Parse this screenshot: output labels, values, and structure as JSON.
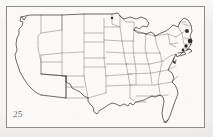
{
  "document": {
    "kind": "scanned-outline-map",
    "page_number": "25",
    "subject": "Contiguous United States state-boundary outline map",
    "frame": {
      "visible": true,
      "style": "thin single rule rectangle"
    }
  },
  "colors": {
    "background": "#f4f3f1",
    "plate": "#fbfaf9",
    "frame_line": "#8e8c89",
    "coastline": "#3a3936",
    "state_line": "#6b6a66",
    "ink_blob": "#2b2a28",
    "page_number_text": "#4a4845"
  },
  "map": {
    "title": "",
    "projection_note": "",
    "outline_stroke_width": 0.7,
    "state_stroke_width": 0.45,
    "ink_marks": [
      {
        "name": "northeast-ink-mark-1",
        "cx": 187,
        "cy": 31,
        "r": 1.9
      },
      {
        "name": "northeast-ink-mark-2",
        "cx": 190,
        "cy": 41,
        "r": 2.3
      },
      {
        "name": "northeast-ink-mark-3",
        "cx": 186,
        "cy": 46,
        "r": 1.7
      },
      {
        "name": "northeast-ink-mark-4",
        "cx": 183,
        "cy": 50,
        "r": 1.4
      },
      {
        "name": "great-lakes-ink-mark",
        "cx": 112,
        "cy": 18,
        "r": 1.2
      },
      {
        "name": "mid-atlantic-ink-mark",
        "cx": 174,
        "cy": 62,
        "r": 1.1
      }
    ],
    "regions": [
      {
        "name": "pacific-northwest",
        "states": [
          "Washington",
          "Oregon",
          "Idaho"
        ]
      },
      {
        "name": "california-nevada",
        "states": [
          "California",
          "Nevada"
        ]
      },
      {
        "name": "mountain-west",
        "states": [
          "Montana",
          "Wyoming",
          "Utah",
          "Colorado"
        ]
      },
      {
        "name": "southwest",
        "states": [
          "Arizona",
          "New Mexico"
        ]
      },
      {
        "name": "great-plains",
        "states": [
          "North Dakota",
          "South Dakota",
          "Nebraska",
          "Kansas",
          "Oklahoma",
          "Texas"
        ]
      },
      {
        "name": "upper-midwest",
        "states": [
          "Minnesota",
          "Iowa",
          "Wisconsin",
          "Michigan",
          "Illinois",
          "Indiana",
          "Ohio"
        ]
      },
      {
        "name": "south-central",
        "states": [
          "Missouri",
          "Arkansas",
          "Louisiana",
          "Mississippi",
          "Tennessee",
          "Kentucky"
        ]
      },
      {
        "name": "southeast",
        "states": [
          "Alabama",
          "Georgia",
          "Florida",
          "South Carolina",
          "North Carolina",
          "Virginia",
          "West Virginia"
        ]
      },
      {
        "name": "mid-atlantic",
        "states": [
          "Maryland",
          "Delaware",
          "Pennsylvania",
          "New Jersey",
          "New York"
        ]
      },
      {
        "name": "new-england",
        "states": [
          "Maine",
          "New Hampshire",
          "Vermont",
          "Massachusetts",
          "Rhode Island",
          "Connecticut"
        ]
      }
    ]
  }
}
